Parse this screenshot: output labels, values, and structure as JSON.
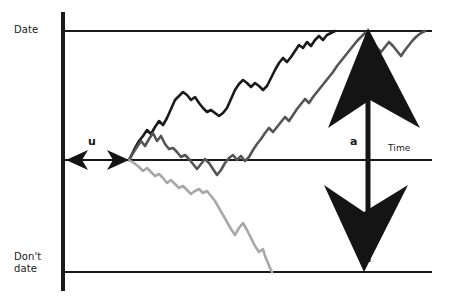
{
  "figure": {
    "background_color": "#ffffff"
  },
  "labels": {
    "y_top": "Date",
    "y_bottom": "Don't\ndate",
    "x_axis": "Time",
    "interval_u": "u",
    "decision_point_a": "a"
  },
  "colors": {
    "axis": "#1a1a1a",
    "series_1": "#1a1a1a",
    "series_2": "#555555",
    "series_3": "#a8a8a8",
    "arrow": "#141414"
  },
  "chart_data": {
    "type": "line",
    "xlabel": "Time",
    "ylabel": "",
    "ytick_labels": [
      "Date",
      "Don't date"
    ],
    "xtick_labels": [
      "u",
      "a"
    ],
    "grid": false,
    "legend": "none",
    "axis_lines": {
      "y_axis_x": 63,
      "top_rule_y": 31,
      "middle_rule_y": 160,
      "bottom_rule_y": 272,
      "rule_x_start": 63,
      "rule_x_end": 432
    },
    "annotations": [
      {
        "name": "interval-u",
        "label": "u",
        "type": "double-arrow",
        "x_from": 66,
        "x_to": 129,
        "y": 160
      },
      {
        "name": "decision-a",
        "label": "a",
        "type": "double-arrow-vertical",
        "x": 368,
        "y_from": 28,
        "y_to": 272
      }
    ],
    "series": [
      {
        "name": "series_1",
        "color": "#1a1a1a",
        "description": "upper random walk rising from u to Date line",
        "points": [
          [
            129,
            160
          ],
          [
            134,
            150
          ],
          [
            139,
            141
          ],
          [
            143,
            136
          ],
          [
            147,
            130
          ],
          [
            151,
            134
          ],
          [
            155,
            127
          ],
          [
            159,
            121
          ],
          [
            163,
            125
          ],
          [
            167,
            118
          ],
          [
            171,
            109
          ],
          [
            175,
            100
          ],
          [
            179,
            96
          ],
          [
            183,
            92
          ],
          [
            187,
            95
          ],
          [
            191,
            100
          ],
          [
            195,
            97
          ],
          [
            199,
            103
          ],
          [
            203,
            108
          ],
          [
            207,
            112
          ],
          [
            211,
            110
          ],
          [
            215,
            113
          ],
          [
            219,
            116
          ],
          [
            223,
            113
          ],
          [
            227,
            108
          ],
          [
            231,
            99
          ],
          [
            235,
            90
          ],
          [
            239,
            84
          ],
          [
            243,
            80
          ],
          [
            247,
            83
          ],
          [
            251,
            87
          ],
          [
            255,
            83
          ],
          [
            259,
            86
          ],
          [
            263,
            90
          ],
          [
            267,
            86
          ],
          [
            271,
            78
          ],
          [
            275,
            70
          ],
          [
            279,
            63
          ],
          [
            283,
            58
          ],
          [
            287,
            62
          ],
          [
            291,
            57
          ],
          [
            295,
            51
          ],
          [
            299,
            45
          ],
          [
            303,
            48
          ],
          [
            307,
            42
          ],
          [
            311,
            46
          ],
          [
            315,
            40
          ],
          [
            319,
            36
          ],
          [
            323,
            40
          ],
          [
            327,
            35
          ],
          [
            331,
            33
          ],
          [
            335,
            31
          ]
        ]
      },
      {
        "name": "series_2",
        "color": "#555555",
        "description": "middle random walk rising late to Date line",
        "points": [
          [
            129,
            160
          ],
          [
            133,
            153
          ],
          [
            137,
            147
          ],
          [
            141,
            141
          ],
          [
            145,
            146
          ],
          [
            149,
            139
          ],
          [
            153,
            133
          ],
          [
            157,
            141
          ],
          [
            161,
            136
          ],
          [
            165,
            144
          ],
          [
            169,
            149
          ],
          [
            173,
            148
          ],
          [
            177,
            152
          ],
          [
            181,
            157
          ],
          [
            185,
            155
          ],
          [
            189,
            159
          ],
          [
            193,
            164
          ],
          [
            197,
            169
          ],
          [
            201,
            164
          ],
          [
            205,
            159
          ],
          [
            209,
            163
          ],
          [
            213,
            169
          ],
          [
            217,
            175
          ],
          [
            221,
            170
          ],
          [
            225,
            163
          ],
          [
            229,
            158
          ],
          [
            233,
            155
          ],
          [
            237,
            160
          ],
          [
            241,
            156
          ],
          [
            245,
            161
          ],
          [
            249,
            157
          ],
          [
            253,
            150
          ],
          [
            257,
            144
          ],
          [
            261,
            139
          ],
          [
            265,
            133
          ],
          [
            269,
            128
          ],
          [
            273,
            132
          ],
          [
            277,
            127
          ],
          [
            281,
            122
          ],
          [
            285,
            117
          ],
          [
            289,
            121
          ],
          [
            293,
            115
          ],
          [
            297,
            109
          ],
          [
            301,
            104
          ],
          [
            305,
            99
          ],
          [
            309,
            103
          ],
          [
            313,
            97
          ],
          [
            317,
            92
          ],
          [
            321,
            87
          ],
          [
            325,
            82
          ],
          [
            329,
            77
          ],
          [
            333,
            72
          ],
          [
            337,
            66
          ],
          [
            341,
            61
          ],
          [
            345,
            56
          ],
          [
            349,
            51
          ],
          [
            353,
            46
          ],
          [
            357,
            41
          ],
          [
            361,
            37
          ],
          [
            365,
            33
          ],
          [
            369,
            38
          ],
          [
            373,
            43
          ],
          [
            377,
            48
          ],
          [
            381,
            52
          ],
          [
            385,
            47
          ],
          [
            389,
            42
          ],
          [
            393,
            46
          ],
          [
            397,
            51
          ],
          [
            401,
            56
          ],
          [
            405,
            50
          ],
          [
            409,
            45
          ],
          [
            413,
            40
          ],
          [
            417,
            36
          ],
          [
            421,
            33
          ],
          [
            425,
            31
          ]
        ]
      },
      {
        "name": "series_3",
        "color": "#a8a8a8",
        "description": "lower random walk descending from u to Don't date line",
        "points": [
          [
            129,
            160
          ],
          [
            134,
            163
          ],
          [
            139,
            167
          ],
          [
            143,
            171
          ],
          [
            147,
            168
          ],
          [
            151,
            172
          ],
          [
            155,
            176
          ],
          [
            159,
            174
          ],
          [
            163,
            178
          ],
          [
            167,
            183
          ],
          [
            171,
            180
          ],
          [
            175,
            184
          ],
          [
            179,
            188
          ],
          [
            183,
            186
          ],
          [
            187,
            190
          ],
          [
            191,
            194
          ],
          [
            195,
            191
          ],
          [
            199,
            189
          ],
          [
            203,
            193
          ],
          [
            207,
            191
          ],
          [
            211,
            196
          ],
          [
            215,
            201
          ],
          [
            219,
            208
          ],
          [
            223,
            215
          ],
          [
            227,
            222
          ],
          [
            231,
            229
          ],
          [
            235,
            235
          ],
          [
            239,
            228
          ],
          [
            243,
            223
          ],
          [
            247,
            230
          ],
          [
            251,
            238
          ],
          [
            255,
            246
          ],
          [
            259,
            252
          ],
          [
            263,
            249
          ],
          [
            265,
            256
          ],
          [
            268,
            263
          ],
          [
            270,
            268
          ],
          [
            272,
            272
          ]
        ]
      }
    ]
  }
}
